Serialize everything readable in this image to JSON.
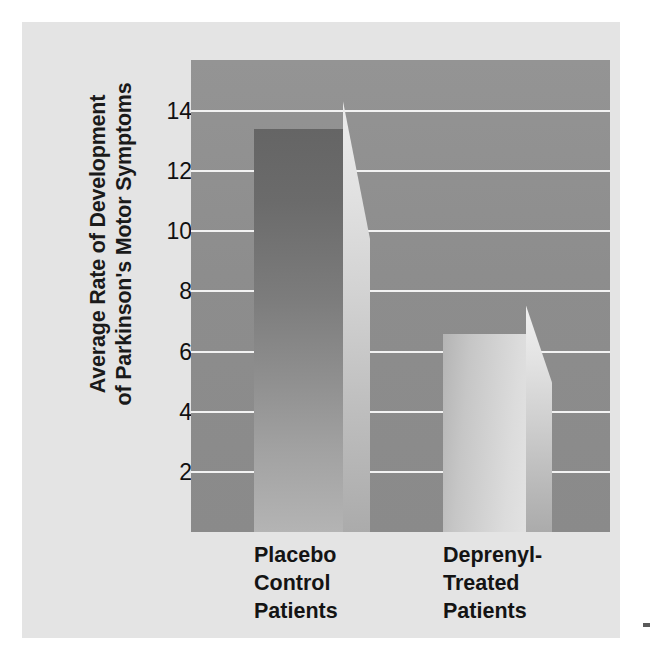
{
  "chart_data": {
    "type": "bar",
    "title": "",
    "subtitle": "",
    "xlabel": "",
    "ylabel_lines": [
      "Average Rate of Development",
      "of Parkinson's Motor Symptoms"
    ],
    "ylabel": "Average Rate of Development of Parkinson's Motor Symptoms",
    "categories": [
      "Placebo Control Patients",
      "Deprenyl-Treated Patients"
    ],
    "category_lines": [
      [
        "Placebo",
        "Control",
        "Patients"
      ],
      [
        "Deprenyl-",
        "Treated",
        "Patients"
      ]
    ],
    "values": [
      13.4,
      6.6
    ],
    "ylim": [
      0,
      15.7
    ],
    "yticks": [
      2,
      4,
      6,
      8,
      10,
      12,
      14
    ],
    "ytick_labels": [
      "2",
      "4",
      "6",
      "8",
      "10",
      "12",
      "14"
    ],
    "grid": true,
    "grid_color": "#f2f2f2",
    "legend": "none",
    "style": "3d-bar",
    "bar_styles": [
      "dark-gradient",
      "light-gradient"
    ]
  },
  "colors": {
    "figure_background": "#e4e4e4",
    "plot_background": "#8e8e8e",
    "gridline": "#f2f2f2",
    "text": "#141414",
    "bar_dark_top": "#656565",
    "bar_dark_bottom": "#b4b4b4",
    "bar_light_left": "#b4b4b4",
    "bar_light_right": "#e2e2e2",
    "bar_side_highlight": "#ececec"
  }
}
